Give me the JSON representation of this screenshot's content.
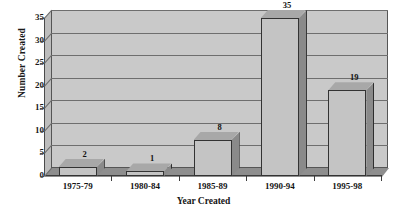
{
  "chart_data": {
    "type": "bar",
    "title": "",
    "subtitle": "",
    "xlabel": "Year Created",
    "ylabel": "Number Created",
    "categories": [
      "1975-79",
      "1980-84",
      "1985-89",
      "1990-94",
      "1995-98"
    ],
    "values": [
      2,
      1,
      8,
      35,
      19
    ],
    "data_labels": [
      "2",
      "1",
      "8",
      "35",
      "19"
    ],
    "series": [
      {
        "name": "Number Created",
        "values": [
          2,
          1,
          8,
          35,
          19
        ]
      }
    ],
    "ylim": [
      0,
      35
    ],
    "ytick_step": 5,
    "ytick_labels": [
      "0",
      "5",
      "10",
      "15",
      "20",
      "25",
      "30",
      "35"
    ],
    "ytick_values": [
      0,
      5,
      10,
      15,
      20,
      25,
      30,
      35
    ],
    "grid": true,
    "grid_axis": "y",
    "legend": false,
    "legend_position": "none",
    "style": "3d-bar",
    "colors": {
      "plot_background": "#c9c9c9",
      "gridline": "#6e6e6e",
      "bar_front": "#c4c4c4",
      "bar_side": "#8a8a8a",
      "bar_top": "#a8a8a8",
      "bar_outline": "#333333",
      "floor": "#8e8e8e",
      "side_wall": "#bdbdbd",
      "axis": "#3c3c3c",
      "text": "#151515",
      "page_background": "#ffffff"
    }
  }
}
